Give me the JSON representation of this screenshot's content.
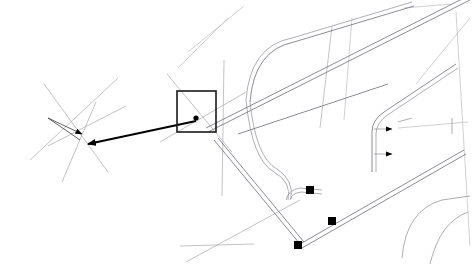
{
  "view": {
    "title": "CAD Drawing View",
    "width": 472,
    "height": 267,
    "background_color": "#ffffff"
  },
  "colors": {
    "construction": "#a9a9ad",
    "construction_faint": "#bcbcc2",
    "path_edge": "#9a9aa2",
    "path_edge_dark": "#6e6e78",
    "annotation": "#3a3a3a",
    "leader": "#000000",
    "selection": "#1a1a1a",
    "marker": "#000000",
    "tick": "#8a8a92"
  },
  "geometry": {
    "construction_lines": [
      {
        "name": "grid-line-upper-left-a",
        "d": "M 44 84 L 108 172"
      },
      {
        "name": "grid-line-upper-left-b",
        "d": "M 30 160 L 118 78"
      },
      {
        "name": "grid-line-upper-left-c",
        "d": "M 96 102 L 62 182"
      },
      {
        "name": "grid-line-upper-left-d",
        "d": "M 48 146 L 126 106"
      },
      {
        "name": "grid-line-box-diagonal",
        "d": "M 167 74 L 232 152"
      },
      {
        "name": "grid-line-box-cross",
        "d": "M 160 142 L 246 92"
      },
      {
        "name": "grid-line-mid-upper",
        "d": "M 178 68 L 228 18"
      },
      {
        "name": "grid-line-top-center",
        "d": "M 188 52 L 244 6"
      },
      {
        "name": "grid-line-vert-left",
        "d": "M 224 60 L 222 196"
      },
      {
        "name": "grid-line-lower-center",
        "d": "M 180 246 L 254 244"
      },
      {
        "name": "grid-line-diag-lowercenter",
        "d": "M 186 262 L 300 200"
      },
      {
        "name": "grid-line-right-vert-a",
        "d": "M 332 26 L 320 128"
      },
      {
        "name": "grid-line-right-vert-b",
        "d": "M 352 18 L 344 120"
      },
      {
        "name": "grid-line-right-diag-a",
        "d": "M 404 8 L 452 4"
      },
      {
        "name": "grid-line-right-diag-b",
        "d": "M 416 84 L 470 18"
      },
      {
        "name": "grid-line-right-lower",
        "d": "M 398 128 L 468 122"
      },
      {
        "name": "grid-line-right-edge",
        "d": "M 456 12 L 470 246"
      }
    ],
    "path_edges": [
      {
        "name": "road-edge-top-long",
        "d": "M 246 100 Q 250 46 292 38 L 412 2"
      },
      {
        "name": "road-edge-top-long-inner",
        "d": "M 250 102 Q 254 50 294 42 L 414 6"
      },
      {
        "name": "road-edge-curve-left",
        "d": "M 246 100 Q 252 160 274 172 Q 292 182 288 200"
      },
      {
        "name": "road-edge-curve-left-inner",
        "d": "M 250 102 Q 256 158 277 169 Q 294 180 291 199"
      },
      {
        "name": "road-diag-main",
        "d": "M 206 128 L 468 -4"
      },
      {
        "name": "road-diag-main-inner",
        "d": "M 208 132 L 470 0"
      },
      {
        "name": "road-diag-lower",
        "d": "M 214 140 L 300 244"
      },
      {
        "name": "road-diag-lower-inner",
        "d": "M 218 138 L 304 242"
      },
      {
        "name": "road-segment-mid",
        "d": "M 238 134 L 388 84"
      },
      {
        "name": "road-elbow-right",
        "d": "M 372 172 L 372 132 Q 372 120 384 112 L 456 64"
      },
      {
        "name": "road-elbow-right-inner",
        "d": "M 376 172 L 376 134 Q 376 124 386 116 L 458 68"
      },
      {
        "name": "road-corner-lower-left",
        "d": "M 286 200 Q 288 190 300 188 L 322 190"
      },
      {
        "name": "road-corner-lower-left-inner",
        "d": "M 290 200 Q 292 193 301 192 L 322 194"
      },
      {
        "name": "road-lower-right-long",
        "d": "M 300 244 L 464 150"
      },
      {
        "name": "road-lower-right-long-inner",
        "d": "M 302 248 L 466 154"
      },
      {
        "name": "road-arc-bottom-right",
        "d": "M 402 258 Q 406 210 442 200 L 470 196"
      },
      {
        "name": "road-arc-bottom-right-b",
        "d": "M 430 264 Q 440 222 468 212"
      }
    ],
    "annotation_triangle": {
      "name": "annotation-triangle",
      "apex": [
        48,
        118
      ],
      "d": "M 48 118 L 86 135 L 48 118 L 84 142 Z"
    },
    "leader": {
      "name": "leader-arrow",
      "start": [
        196,
        121
      ],
      "end": [
        88,
        144
      ]
    },
    "selection_rect": {
      "name": "selection-rectangle",
      "x": 177,
      "y": 91,
      "width": 39,
      "height": 41
    },
    "center_dot": {
      "name": "selection-center-point",
      "cx": 196,
      "cy": 118,
      "r": 2.6
    },
    "vertex_markers": [
      {
        "name": "vertex-marker-upper",
        "cx": 310,
        "cy": 190
      },
      {
        "name": "vertex-marker-middle",
        "cx": 332,
        "cy": 221
      },
      {
        "name": "vertex-marker-lower",
        "cx": 298,
        "cy": 245
      }
    ],
    "tick_marks": [
      {
        "name": "tick-leader-upper",
        "d": "M 374 129 L 392 129"
      },
      {
        "name": "tick-leader-lower",
        "d": "M 374 154 L 392 154"
      },
      {
        "name": "tick-right-upper",
        "d": "M 398 122 L 412 118"
      },
      {
        "name": "tick-right-corner",
        "d": "M 452 118 L 452 134"
      }
    ]
  }
}
